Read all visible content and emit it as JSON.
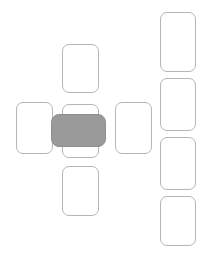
{
  "canvas": {
    "width": 203,
    "height": 257,
    "background": "#ffffff"
  },
  "style": {
    "card_fill": "#ffffff",
    "card_border": "#b5b5b5",
    "selected_fill": "#9a9a9a",
    "selected_border": "#8f8f8f",
    "corner_radius": 7
  },
  "groups": {
    "cross": {
      "name": "cross-cluster",
      "cards": [
        {
          "id": "cross-top",
          "label": "",
          "x": 62,
          "y": 44,
          "w": 37,
          "h": 49,
          "selected": false
        },
        {
          "id": "cross-left",
          "label": "",
          "x": 16,
          "y": 102,
          "w": 37,
          "h": 52,
          "selected": false
        },
        {
          "id": "cross-center-behind",
          "label": "",
          "x": 62,
          "y": 104,
          "w": 37,
          "h": 54,
          "selected": false
        },
        {
          "id": "cross-right",
          "label": "",
          "x": 115,
          "y": 102,
          "w": 37,
          "h": 52,
          "selected": false
        },
        {
          "id": "cross-bottom",
          "label": "",
          "x": 62,
          "y": 166,
          "w": 37,
          "h": 50,
          "selected": false
        },
        {
          "id": "cross-center-selected",
          "label": "",
          "x": 51,
          "y": 114,
          "w": 55,
          "h": 33,
          "selected": true
        }
      ]
    },
    "right_column": {
      "name": "right-card-stack",
      "cards": [
        {
          "id": "stack-1",
          "label": "",
          "x": 160,
          "y": 12,
          "w": 36,
          "h": 60,
          "selected": false
        },
        {
          "id": "stack-2",
          "label": "",
          "x": 160,
          "y": 78,
          "w": 36,
          "h": 53,
          "selected": false
        },
        {
          "id": "stack-3",
          "label": "",
          "x": 160,
          "y": 137,
          "w": 36,
          "h": 53,
          "selected": false
        },
        {
          "id": "stack-4",
          "label": "",
          "x": 160,
          "y": 196,
          "w": 36,
          "h": 50,
          "selected": false
        }
      ]
    }
  }
}
